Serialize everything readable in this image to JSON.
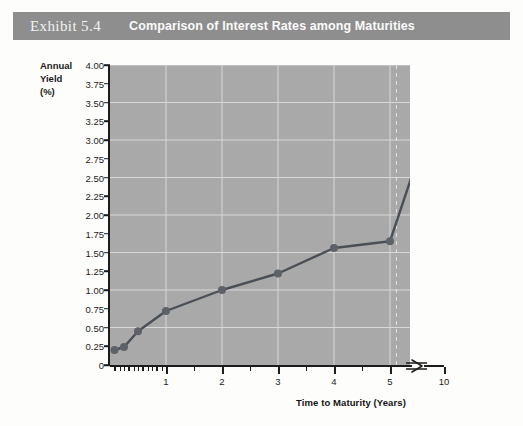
{
  "header": {
    "exhibit_number": "Exhibit 5.4",
    "title": "Comparison of Interest Rates among Maturities",
    "bar_color": "#8e8e8e",
    "text_color": "#f7f7f5"
  },
  "chart_data": {
    "type": "line",
    "title": "Comparison of Interest Rates among Maturities",
    "xlabel": "Time to Maturity (Years)",
    "ylabel": "Annual Yield (%)",
    "ylabel_lines": [
      "Annual",
      "Yield",
      "(%)"
    ],
    "x": [
      0.08,
      0.25,
      0.5,
      1,
      2,
      3,
      4,
      5,
      10
    ],
    "values": [
      0.2,
      0.24,
      0.45,
      0.72,
      1.0,
      1.22,
      1.56,
      1.65,
      3.8
    ],
    "series": [
      {
        "name": "Yield curve",
        "x": [
          0.08,
          0.25,
          0.5,
          1,
          2,
          3,
          4,
          5,
          10
        ],
        "values": [
          0.2,
          0.24,
          0.45,
          0.72,
          1.0,
          1.22,
          1.56,
          1.65,
          3.8
        ]
      }
    ],
    "ylim": [
      0,
      4.0
    ],
    "xlim": [
      0,
      10
    ],
    "y_ticks": [
      0,
      0.25,
      0.5,
      0.75,
      1.0,
      1.25,
      1.5,
      1.75,
      2.0,
      2.25,
      2.5,
      2.75,
      3.0,
      3.25,
      3.5,
      3.75,
      4.0
    ],
    "y_tick_labels": [
      "0",
      "0.25",
      "0.50",
      "0.75",
      "1.00",
      "1.25",
      "1.50",
      "1.75",
      "2.00",
      "2.25",
      "2.50",
      "2.75",
      "3.00",
      "3.25",
      "3.50",
      "3.75",
      "4.00"
    ],
    "x_tick_labels": [
      "1",
      "2",
      "3",
      "4",
      "5",
      "10"
    ],
    "x_tick_values": [
      1,
      2,
      3,
      4,
      5,
      10
    ],
    "x_minor_ticks": [
      0.08,
      0.17,
      0.25,
      0.33,
      0.42,
      0.5,
      0.58,
      0.67,
      0.75,
      0.83,
      0.92,
      1.5,
      2.5,
      3.5,
      4.5
    ],
    "grid": true,
    "grid_color": "#d8d8d8",
    "gridline_y_values": [
      0.5,
      1.0,
      1.5,
      2.0,
      2.5,
      3.0,
      3.5,
      4.0
    ],
    "gridline_x_values": [
      1,
      2,
      3,
      4,
      5
    ],
    "dashed_gridline_x": 5.6,
    "axis_break": true,
    "axis_break_label": "10",
    "plot_bg": "#a9a9a9",
    "line_color": "#4a4f56",
    "marker_color": "#5d6168",
    "legend": "none"
  }
}
